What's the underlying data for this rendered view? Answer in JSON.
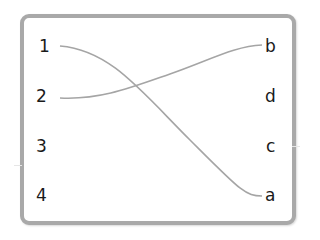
{
  "left_items": [
    {
      "label": "1",
      "x": 39,
      "y": 36
    },
    {
      "label": "2",
      "x": 36,
      "y": 86
    },
    {
      "label": "3",
      "x": 36,
      "y": 136
    },
    {
      "label": "4",
      "x": 36,
      "y": 185
    }
  ],
  "right_items": [
    {
      "label": "b",
      "x": 265,
      "y": 36
    },
    {
      "label": "d",
      "x": 265,
      "y": 86
    },
    {
      "label": "c",
      "x": 266,
      "y": 136
    },
    {
      "label": "a",
      "x": 265,
      "y": 185
    }
  ],
  "connections": [
    {
      "from": "1",
      "to": "a"
    },
    {
      "from": "2",
      "to": "b"
    }
  ],
  "colors": {
    "border": "#a9a9a9",
    "line": "#a5a5a5",
    "text": "#1a1a1a"
  }
}
